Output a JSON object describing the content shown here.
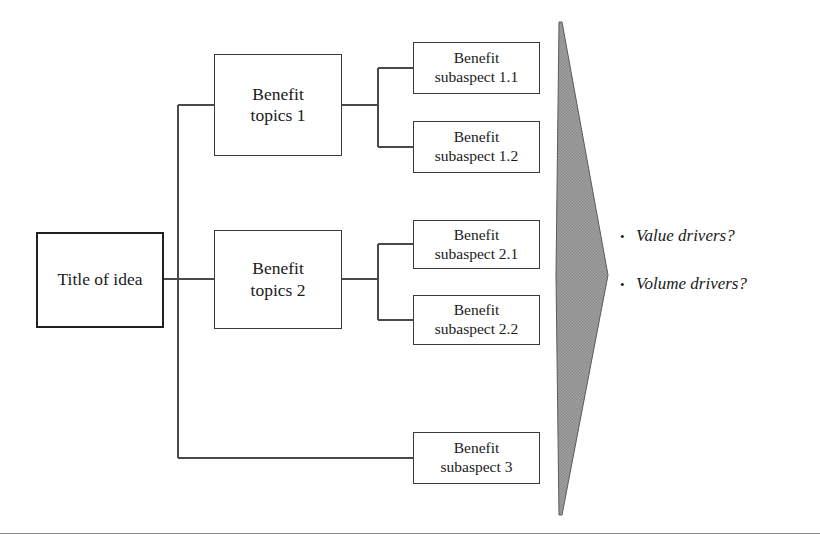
{
  "diagram": {
    "type": "benefit-tree",
    "root": {
      "label": "Title of idea"
    },
    "branches": [
      {
        "topic": {
          "label": "Benefit\ntopics 1"
        },
        "children": [
          {
            "label": "Benefit\nsubaspect 1.1"
          },
          {
            "label": "Benefit\nsubaspect 1.2"
          }
        ]
      },
      {
        "topic": {
          "label": "Benefit\ntopics 2"
        },
        "children": [
          {
            "label": "Benefit\nsubaspect 2.1"
          },
          {
            "label": "Benefit\nsubaspect 2.2"
          }
        ]
      },
      {
        "topic": null,
        "children": [
          {
            "label": "Benefit\nsubaspect 3"
          }
        ]
      }
    ],
    "arrow": {
      "name": "right-pointing-arrow",
      "fill": "#9a9a9a",
      "stroke": "#4a4a4a"
    },
    "callouts": {
      "bullet_glyph": "•",
      "items": [
        {
          "label": "Value drivers?"
        },
        {
          "label": "Volume drivers?"
        }
      ]
    },
    "colors": {
      "box_border": "#3a3a3a",
      "root_border": "#202020",
      "connector": "#4a4a4a",
      "text": "#1a1a1a",
      "background": "#ffffff",
      "rule": "#8b8b8b"
    }
  }
}
